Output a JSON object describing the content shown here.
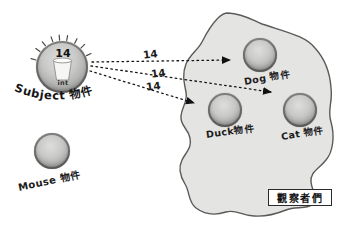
{
  "diagram": {
    "description_label": "observer-pattern-notification-diagram"
  },
  "subject": {
    "value": "14",
    "type_label": "int",
    "name_label": "Subject 物件"
  },
  "arrows": [
    {
      "label": "14"
    },
    {
      "label": "14"
    },
    {
      "label": "14"
    }
  ],
  "observers": {
    "group_label": "觀察者們",
    "members": [
      {
        "label": "Dog 物件"
      },
      {
        "label": "Duck物件"
      },
      {
        "label": "Cat 物件"
      }
    ]
  },
  "outsider": {
    "label": "Mouse 物件"
  },
  "colors": {
    "blob_fill": "#e4e4e3",
    "blob_stroke": "#5a5a58",
    "sphere_base": "#b9b9b7",
    "ink": "#1c1c1c",
    "background": "#ffffff"
  }
}
